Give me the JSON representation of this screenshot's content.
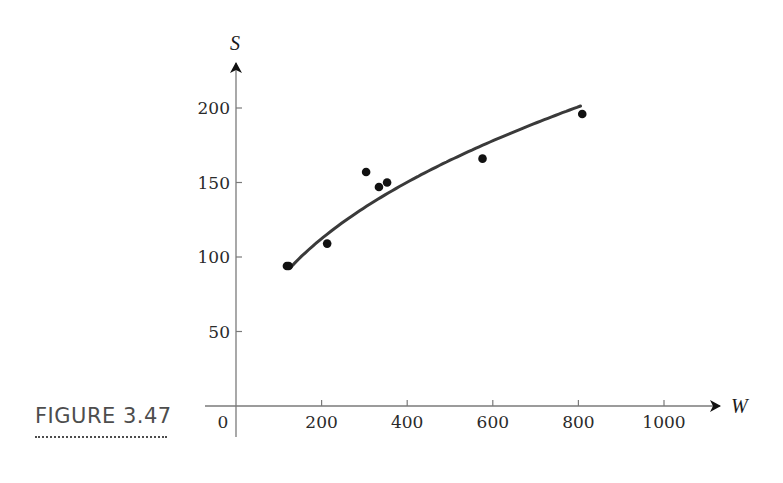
{
  "caption": {
    "label": "FIGURE 3.47",
    "color": "#4d4d4d"
  },
  "colors": {
    "axis": "#7a7a7a",
    "curve": "#3a3a3a",
    "points": "#111111",
    "text": "#2a2a2a"
  },
  "chart_data": {
    "type": "scatter",
    "title": "",
    "xlabel": "W",
    "ylabel": "S",
    "xlim": [
      0,
      1100
    ],
    "ylim": [
      0,
      230
    ],
    "grid": false,
    "legend": null,
    "x_ticks": [
      0,
      200,
      400,
      600,
      800,
      1000
    ],
    "x_tick_labels": [
      "0",
      "200",
      "400",
      "600",
      "800",
      "1000"
    ],
    "y_ticks": [
      50,
      100,
      150,
      200
    ],
    "y_tick_labels": [
      "50",
      "100",
      "150",
      "200"
    ],
    "series": [
      {
        "name": "observations",
        "kind": "points",
        "x": [
          119,
          123,
          213,
          304,
          334,
          353,
          576,
          809
        ],
        "y": [
          94,
          94,
          109,
          157,
          147,
          150,
          166,
          196
        ]
      },
      {
        "name": "fitted curve",
        "kind": "line",
        "model": "S = a * W^b",
        "a": 12.2,
        "b": 0.419,
        "x_range": [
          128,
          805
        ]
      }
    ],
    "annotations": [
      "FIGURE 3.47"
    ]
  }
}
